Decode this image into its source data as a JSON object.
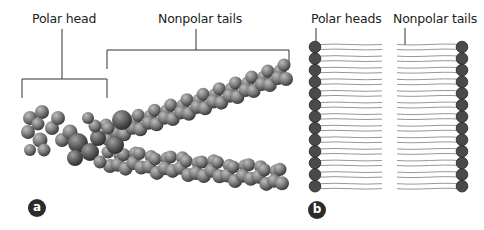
{
  "panel_a": {
    "label_polar_head": "Polar head",
    "label_nonpolar_tails": "Nonpolar tails",
    "badge": "a",
    "atom_color_main": "#7a7a7a",
    "atom_color_head": "#5e5e5e"
  },
  "panel_b": {
    "label_polar_heads": "Polar heads",
    "label_nonpolar_tails": "Nonpolar tails",
    "badge": "b",
    "heads_per_side": 13,
    "head_color": "#4a4a4a",
    "tail_color": "#8a8a8a"
  }
}
